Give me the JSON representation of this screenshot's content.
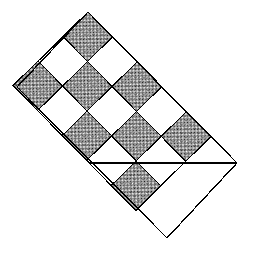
{
  "figure": {
    "title": "Rotated checkerboard rhombus tiling",
    "type": "geometric-diagram",
    "background_color": "#ffffff",
    "stroke_color": "#000000",
    "fill_dark_color": "#3a3a3a",
    "fill_light_color": "#ffffff",
    "pattern_name": "dense-dither-checker",
    "canvas": {
      "width": 255,
      "height": 259
    },
    "rotation_degrees": 45.5,
    "cell_size_px": 35,
    "grid": {
      "rows": 3,
      "cols": 5
    },
    "vertices": {
      "top": [
        88,
        12
      ],
      "left": [
        17,
        87
      ],
      "right": [
        237,
        163
      ],
      "bottom": [
        167,
        238
      ]
    },
    "divider_line": {
      "from": [
        90,
        163
      ],
      "to": [
        237,
        163
      ]
    },
    "cells": [
      {
        "row": 0,
        "col": 0,
        "fill": "dark"
      },
      {
        "row": 0,
        "col": 1,
        "fill": "light"
      },
      {
        "row": 0,
        "col": 2,
        "fill": "dark"
      },
      {
        "row": 0,
        "col": 3,
        "fill": "light"
      },
      {
        "row": 0,
        "col": 4,
        "fill": "dark"
      },
      {
        "row": 1,
        "col": 0,
        "fill": "light"
      },
      {
        "row": 1,
        "col": 1,
        "fill": "dark"
      },
      {
        "row": 1,
        "col": 2,
        "fill": "light"
      },
      {
        "row": 1,
        "col": 3,
        "fill": "dark"
      },
      {
        "row": 1,
        "col": 4,
        "fill": "light"
      },
      {
        "row": 2,
        "col": 0,
        "fill": "dark"
      },
      {
        "row": 2,
        "col": 1,
        "fill": "light"
      },
      {
        "row": 2,
        "col": 2,
        "fill": "dark"
      },
      {
        "row": 2,
        "col": 3,
        "fill": "light"
      },
      {
        "row": 2,
        "col": 4,
        "fill": "dark"
      }
    ],
    "corner_triangles": [
      {
        "position": "top-apex-left",
        "fill": "light"
      },
      {
        "position": "top-apex-right",
        "fill": "dark"
      },
      {
        "position": "left-vertex-upper",
        "fill": "light"
      },
      {
        "position": "left-vertex-lower",
        "fill": "dark"
      },
      {
        "position": "right-vertex-upper",
        "fill": "dark"
      },
      {
        "position": "right-vertex-lower",
        "fill": "light"
      },
      {
        "position": "bottom-vertex-left",
        "fill": "dark"
      },
      {
        "position": "bottom-vertex-right",
        "fill": "light"
      }
    ]
  }
}
